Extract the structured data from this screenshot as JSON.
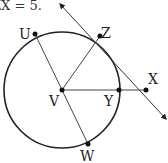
{
  "caption": "ZX = 5.",
  "points": {
    "U": {
      "label": "U",
      "x": 35,
      "y": 34
    },
    "Z": {
      "label": "Z",
      "x": 100,
      "y": 36
    },
    "V": {
      "label": "V",
      "x": 62,
      "y": 90
    },
    "Y": {
      "label": "Y",
      "x": 119,
      "y": 90
    },
    "X": {
      "label": "X",
      "x": 146,
      "y": 90
    },
    "W": {
      "label": "W",
      "x": 88,
      "y": 144
    }
  },
  "circle": {
    "center": "V",
    "cx": 62,
    "cy": 90,
    "r": 58
  },
  "segments": [
    [
      "V",
      "U"
    ],
    [
      "V",
      "Z"
    ],
    [
      "V",
      "X"
    ],
    [
      "V",
      "W"
    ]
  ],
  "tangent_line": {
    "through": [
      "Z",
      "X"
    ],
    "from": [
      60,
      4
    ],
    "to": [
      166,
      119
    ]
  },
  "colors": {
    "stroke": "#222222",
    "background": "#ffffff"
  }
}
